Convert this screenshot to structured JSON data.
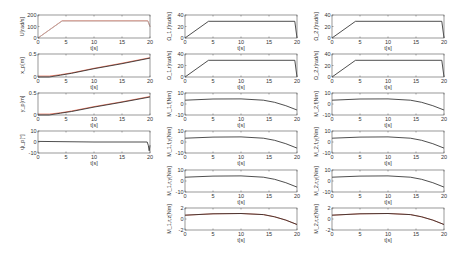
{
  "chart_data": [
    {
      "id": "p1",
      "type": "line",
      "col": 0,
      "row": 0,
      "ylabel": "U[rad/s]",
      "xlabel": "t[s]",
      "xlim": [
        0,
        20
      ],
      "ylim": [
        0,
        200
      ],
      "yticks": [
        0,
        100,
        200
      ],
      "xticks": [
        0,
        5,
        10,
        15,
        20
      ],
      "series": [
        {
          "name": "reference",
          "color": "#e8705a",
          "x": [
            0,
            4.3,
            19.6,
            20
          ],
          "y": [
            0,
            150,
            150,
            100
          ]
        },
        {
          "name": "actual",
          "color": "#b0b0b0",
          "x": [
            0,
            4.3,
            19.6,
            20
          ],
          "y": [
            0,
            148,
            148,
            98
          ]
        }
      ]
    },
    {
      "id": "p2",
      "type": "line",
      "col": 0,
      "row": 1,
      "ylabel": "x_p[m]",
      "xlabel": "t[s]",
      "xlim": [
        0,
        20
      ],
      "ylim": [
        0,
        0.5
      ],
      "yticks": [
        0,
        0.5
      ],
      "xticks": [
        0,
        5,
        10,
        15,
        20
      ],
      "series": [
        {
          "name": "reference",
          "color": "#e8705a",
          "x": [
            0,
            2,
            4,
            6,
            10,
            15,
            20
          ],
          "y": [
            0.02,
            0.02,
            0.05,
            0.09,
            0.19,
            0.3,
            0.42
          ]
        },
        {
          "name": "actual",
          "color": "#222222",
          "x": [
            0,
            2,
            4,
            6,
            10,
            15,
            20
          ],
          "y": [
            0.0,
            0.0,
            0.04,
            0.08,
            0.18,
            0.29,
            0.41
          ]
        }
      ]
    },
    {
      "id": "p3",
      "type": "line",
      "col": 0,
      "row": 2,
      "ylabel": "y_p[m]",
      "xlabel": "t[s]",
      "xlim": [
        0,
        20
      ],
      "ylim": [
        0,
        0.5
      ],
      "yticks": [
        0,
        0.5
      ],
      "xticks": [
        0,
        5,
        10,
        15,
        20
      ],
      "series": [
        {
          "name": "reference",
          "color": "#e8705a",
          "x": [
            0,
            2,
            4,
            6,
            10,
            15,
            20
          ],
          "y": [
            0.02,
            0.02,
            0.05,
            0.09,
            0.19,
            0.3,
            0.42
          ]
        },
        {
          "name": "actual",
          "color": "#222222",
          "x": [
            0,
            2,
            4,
            6,
            10,
            15,
            20
          ],
          "y": [
            0.0,
            0.0,
            0.04,
            0.08,
            0.18,
            0.29,
            0.41
          ]
        }
      ]
    },
    {
      "id": "p4",
      "type": "line",
      "col": 0,
      "row": 3,
      "ylabel": "ψ_p[°]",
      "xlabel": "t[s]",
      "xlim": [
        0,
        20
      ],
      "ylim": [
        -10,
        10
      ],
      "yticks": [
        -10,
        0,
        10
      ],
      "xticks": [
        0,
        5,
        10,
        15,
        20
      ],
      "series": [
        {
          "name": "actual",
          "color": "#222222",
          "x": [
            0,
            10,
            19.5,
            19.7,
            19.85,
            20
          ],
          "y": [
            0.5,
            0,
            0,
            -3,
            -8,
            -3
          ]
        }
      ]
    },
    {
      "id": "p5",
      "type": "line",
      "col": 1,
      "row": 0,
      "ylabel": "Ω_1,f[rad/s]",
      "xlabel": "t[s]",
      "xlim": [
        0,
        20
      ],
      "ylim": [
        0,
        40
      ],
      "yticks": [
        0,
        20,
        40
      ],
      "xticks": [
        0,
        5,
        10,
        15,
        20
      ],
      "series": [
        {
          "name": "actual",
          "color": "#222222",
          "x": [
            0,
            4.2,
            19.6,
            20
          ],
          "y": [
            0,
            29,
            29,
            0
          ]
        }
      ]
    },
    {
      "id": "p6",
      "type": "line",
      "col": 1,
      "row": 1,
      "ylabel": "Ω_1,r[rad/s]",
      "xlabel": "t[s]",
      "xlim": [
        0,
        20
      ],
      "ylim": [
        0,
        40
      ],
      "yticks": [
        0,
        20,
        40
      ],
      "xticks": [
        0,
        5,
        10,
        15,
        20
      ],
      "series": [
        {
          "name": "actual",
          "color": "#222222",
          "x": [
            0,
            4.2,
            19.6,
            20
          ],
          "y": [
            0,
            29,
            29,
            0
          ]
        }
      ]
    },
    {
      "id": "p7",
      "type": "line",
      "col": 2,
      "row": 0,
      "ylabel": "Ω_2,f[rad/s]",
      "xlabel": "t[s]",
      "xlim": [
        0,
        20
      ],
      "ylim": [
        0,
        40
      ],
      "yticks": [
        0,
        20,
        40
      ],
      "xticks": [
        0,
        5,
        10,
        15,
        20
      ],
      "series": [
        {
          "name": "actual",
          "color": "#222222",
          "x": [
            0,
            4.2,
            19.6,
            20
          ],
          "y": [
            0,
            29,
            29,
            0
          ]
        }
      ]
    },
    {
      "id": "p8",
      "type": "line",
      "col": 2,
      "row": 1,
      "ylabel": "Ω_2,r[rad/s]",
      "xlabel": "t[s]",
      "xlim": [
        0,
        20
      ],
      "ylim": [
        0,
        40
      ],
      "yticks": [
        0,
        20,
        40
      ],
      "xticks": [
        0,
        5,
        10,
        15,
        20
      ],
      "series": [
        {
          "name": "actual",
          "color": "#222222",
          "x": [
            0,
            4.2,
            19.6,
            20
          ],
          "y": [
            0,
            29,
            29,
            0
          ]
        }
      ]
    },
    {
      "id": "p9",
      "type": "line",
      "col": 1,
      "row": 2,
      "ylabel": "M_1,f[Nm]",
      "xlabel": "t[s]",
      "xlim": [
        0,
        20
      ],
      "ylim": [
        -10,
        10
      ],
      "yticks": [
        -10,
        0,
        10
      ],
      "xticks": [
        0,
        5,
        10,
        15,
        20
      ],
      "series": [
        {
          "name": "actual",
          "color": "#222222",
          "x": [
            0,
            5,
            10,
            14,
            16,
            18,
            20
          ],
          "y": [
            3.5,
            4.5,
            4.6,
            3.5,
            1.5,
            -1.5,
            -5.5
          ]
        }
      ]
    },
    {
      "id": "p10",
      "type": "line",
      "col": 1,
      "row": 3,
      "ylabel": "M_1,f,y[Nm]",
      "xlabel": "t[s]",
      "xlim": [
        0,
        20
      ],
      "ylim": [
        -10,
        10
      ],
      "yticks": [
        -10,
        0,
        10
      ],
      "xticks": [
        0,
        5,
        10,
        15,
        20
      ],
      "series": [
        {
          "name": "actual",
          "color": "#222222",
          "x": [
            0,
            5,
            10,
            14,
            16,
            18,
            20
          ],
          "y": [
            3.5,
            4.5,
            4.6,
            3.5,
            1.5,
            -1.5,
            -5.5
          ]
        }
      ]
    },
    {
      "id": "p11",
      "type": "line",
      "col": 1,
      "row": 4,
      "ylabel": "M_1,r,y[Nm]",
      "xlabel": "t[s]",
      "xlim": [
        0,
        20
      ],
      "ylim": [
        -10,
        10
      ],
      "yticks": [
        -10,
        0,
        10
      ],
      "xticks": [
        0,
        5,
        10,
        15,
        20
      ],
      "series": [
        {
          "name": "actual",
          "color": "#222222",
          "x": [
            0,
            5,
            10,
            14,
            16,
            18,
            20
          ],
          "y": [
            3.5,
            4.5,
            4.6,
            3.5,
            1.5,
            -1.5,
            -5.5
          ]
        }
      ]
    },
    {
      "id": "p12",
      "type": "line",
      "col": 1,
      "row": 5,
      "ylabel": "M_1,r,z[Nm]",
      "xlabel": "t[s]",
      "xlim": [
        0,
        20
      ],
      "ylim": [
        -2,
        2
      ],
      "yticks": [
        -2,
        0,
        2
      ],
      "xticks": [
        0,
        5,
        10,
        15,
        20
      ],
      "series": [
        {
          "name": "reference",
          "color": "#e8705a",
          "x": [
            0,
            5,
            10,
            14,
            16,
            18,
            20
          ],
          "y": [
            0.7,
            0.95,
            1.0,
            0.8,
            0.4,
            -0.2,
            -1.0
          ]
        },
        {
          "name": "actual",
          "color": "#222222",
          "x": [
            0,
            5,
            10,
            14,
            16,
            18,
            20
          ],
          "y": [
            0.7,
            0.95,
            1.0,
            0.8,
            0.4,
            -0.2,
            -1.0
          ]
        }
      ]
    },
    {
      "id": "p13",
      "type": "line",
      "col": 2,
      "row": 2,
      "ylabel": "M_2,f[Nm]",
      "xlabel": "t[s]",
      "xlim": [
        0,
        20
      ],
      "ylim": [
        -10,
        10
      ],
      "yticks": [
        -10,
        0,
        10
      ],
      "xticks": [
        0,
        5,
        10,
        15,
        20
      ],
      "series": [
        {
          "name": "actual",
          "color": "#222222",
          "x": [
            0,
            5,
            10,
            14,
            16,
            18,
            20
          ],
          "y": [
            3.5,
            4.5,
            4.6,
            3.5,
            1.5,
            -1.5,
            -5.5
          ]
        }
      ]
    },
    {
      "id": "p14",
      "type": "line",
      "col": 2,
      "row": 3,
      "ylabel": "M_2,f,y[Nm]",
      "xlabel": "t[s]",
      "xlim": [
        0,
        20
      ],
      "ylim": [
        -10,
        10
      ],
      "yticks": [
        -10,
        0,
        10
      ],
      "xticks": [
        0,
        5,
        10,
        15,
        20
      ],
      "series": [
        {
          "name": "actual",
          "color": "#222222",
          "x": [
            0,
            5,
            10,
            14,
            16,
            18,
            20
          ],
          "y": [
            3.5,
            4.5,
            4.6,
            3.5,
            1.5,
            -1.5,
            -5.5
          ]
        }
      ]
    },
    {
      "id": "p15",
      "type": "line",
      "col": 2,
      "row": 4,
      "ylabel": "M_2,r,y[Nm]",
      "xlabel": "t[s]",
      "xlim": [
        0,
        20
      ],
      "ylim": [
        -10,
        10
      ],
      "yticks": [
        -10,
        0,
        10
      ],
      "xticks": [
        0,
        5,
        10,
        15,
        20
      ],
      "series": [
        {
          "name": "actual",
          "color": "#222222",
          "x": [
            0,
            5,
            10,
            14,
            16,
            18,
            20
          ],
          "y": [
            3.5,
            4.5,
            4.6,
            3.5,
            1.5,
            -1.5,
            -5.5
          ]
        }
      ]
    },
    {
      "id": "p16",
      "type": "line",
      "col": 2,
      "row": 5,
      "ylabel": "M_2,r,z[Nm]",
      "xlabel": "t[s]",
      "xlim": [
        0,
        20
      ],
      "ylim": [
        -2,
        2
      ],
      "yticks": [
        -2,
        0,
        2
      ],
      "xticks": [
        0,
        5,
        10,
        15,
        20
      ],
      "series": [
        {
          "name": "reference",
          "color": "#e8705a",
          "x": [
            0,
            5,
            10,
            14,
            16,
            18,
            20
          ],
          "y": [
            0.7,
            0.95,
            1.0,
            0.8,
            0.4,
            -0.2,
            -1.0
          ]
        },
        {
          "name": "actual",
          "color": "#222222",
          "x": [
            0,
            5,
            10,
            14,
            16,
            18,
            20
          ],
          "y": [
            0.7,
            0.95,
            1.0,
            0.8,
            0.4,
            -0.2,
            -1.0
          ]
        }
      ]
    }
  ],
  "layout": {
    "cols_x": [
      [
        38,
        150
      ],
      [
        185,
        297
      ],
      [
        332,
        444
      ]
    ],
    "rows_y": [
      [
        15,
        38
      ],
      [
        54,
        77
      ],
      [
        93,
        115
      ],
      [
        131,
        153
      ],
      [
        170,
        192
      ],
      [
        208,
        230
      ]
    ]
  }
}
